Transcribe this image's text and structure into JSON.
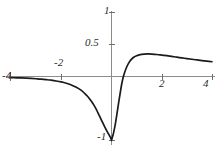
{
  "chart_data": {
    "type": "line",
    "title": "",
    "subtitle": "",
    "xlabel": "",
    "ylabel": "",
    "xlim": [
      -4,
      4
    ],
    "ylim": [
      -1,
      1
    ],
    "grid": false,
    "legend": false,
    "legend_position": "none",
    "axis_style": "centered-cross",
    "xticks": [
      -4,
      -2,
      2,
      4
    ],
    "xtick_labels": [
      "-4",
      "-2",
      "2",
      "4"
    ],
    "yticks": [
      0.5,
      1,
      -1
    ],
    "ytick_labels": [
      "0.5",
      "1",
      "-1"
    ],
    "annotations": [
      {
        "text": "sharp minimum at x near 0",
        "x": 0.05,
        "y": -1.0
      },
      {
        "text": "local maximum",
        "x": 1.45,
        "y": 0.36
      }
    ],
    "series": [
      {
        "name": "curve",
        "color": "#1a1a1a",
        "x": [
          -4.0,
          -3.8,
          -3.6,
          -3.4,
          -3.2,
          -3.0,
          -2.8,
          -2.6,
          -2.4,
          -2.2,
          -2.0,
          -1.8,
          -1.6,
          -1.4,
          -1.2,
          -1.0,
          -0.9,
          -0.8,
          -0.7,
          -0.6,
          -0.5,
          -0.42,
          -0.35,
          -0.28,
          -0.22,
          -0.17,
          -0.13,
          -0.09,
          -0.06,
          -0.035,
          -0.018,
          -0.008,
          -0.002,
          0.0,
          0.002,
          0.008,
          0.018,
          0.035,
          0.06,
          0.09,
          0.13,
          0.17,
          0.22,
          0.28,
          0.35,
          0.42,
          0.5,
          0.6,
          0.7,
          0.8,
          0.9,
          1.0,
          1.1,
          1.2,
          1.3,
          1.45,
          1.6,
          1.8,
          2.0,
          2.2,
          2.4,
          2.6,
          2.8,
          3.0,
          3.2,
          3.4,
          3.6,
          3.8,
          4.0
        ],
        "y": [
          -0.018,
          -0.02,
          -0.023,
          -0.026,
          -0.03,
          -0.035,
          -0.041,
          -0.049,
          -0.058,
          -0.07,
          -0.085,
          -0.105,
          -0.132,
          -0.168,
          -0.218,
          -0.29,
          -0.335,
          -0.388,
          -0.448,
          -0.518,
          -0.6,
          -0.665,
          -0.722,
          -0.778,
          -0.824,
          -0.862,
          -0.89,
          -0.918,
          -0.94,
          -0.958,
          -0.975,
          -0.986,
          -0.996,
          -1.0,
          -0.996,
          -0.986,
          -0.972,
          -0.95,
          -0.915,
          -0.865,
          -0.79,
          -0.7,
          -0.575,
          -0.42,
          -0.25,
          -0.09,
          0.035,
          0.145,
          0.22,
          0.272,
          0.305,
          0.325,
          0.338,
          0.346,
          0.35,
          0.352,
          0.35,
          0.344,
          0.335,
          0.325,
          0.314,
          0.302,
          0.291,
          0.28,
          0.269,
          0.259,
          0.249,
          0.24,
          0.231
        ]
      }
    ]
  },
  "labels": {
    "x_neg4": "-4",
    "x_neg2": "-2",
    "x_pos2": "2",
    "x_pos4": "4",
    "y_half": "0.5",
    "y_one": "1",
    "y_neg_one": "-1"
  }
}
